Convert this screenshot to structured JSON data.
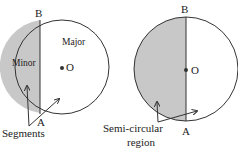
{
  "left_figure": {
    "point_top": "B",
    "point_bottom": "A",
    "center": "O",
    "major_label": "Major",
    "minor_label": "Minor",
    "pointer_label": "Segments"
  },
  "right_figure": {
    "point_top": "B",
    "point_bottom": "A",
    "center": "O",
    "pointer_label_line1": "Semi-circular",
    "pointer_label_line2": "region"
  },
  "colors": {
    "stroke": "#333333",
    "shade": "#c8c8c8"
  }
}
